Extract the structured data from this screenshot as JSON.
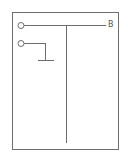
{
  "diagram": {
    "type": "schematic",
    "frame": {
      "x": 12,
      "y": 12,
      "width": 106,
      "height": 137,
      "stroke": "#6e6e6e"
    },
    "line_color": "#6e6e6e",
    "nodes": [
      {
        "id": "terminal-1",
        "shape": "circle",
        "cx": 21,
        "cy": 25,
        "r": 3
      },
      {
        "id": "terminal-2",
        "shape": "circle",
        "cx": 21,
        "cy": 43,
        "r": 3
      }
    ],
    "lines": [
      {
        "id": "top-bus",
        "x1": 24,
        "y1": 25,
        "x2": 106,
        "y2": 25
      },
      {
        "id": "vertical-trunk",
        "x1": 66,
        "y1": 25,
        "x2": 66,
        "y2": 143
      },
      {
        "id": "terminal-2-lead",
        "x1": 24,
        "y1": 43,
        "x2": 45,
        "y2": 43
      },
      {
        "id": "terminal-2-drop",
        "x1": 45,
        "y1": 43,
        "x2": 45,
        "y2": 60
      },
      {
        "id": "ground-bar",
        "x1": 38,
        "y1": 60,
        "x2": 54,
        "y2": 60
      }
    ],
    "labels": [
      {
        "id": "label-b",
        "text": "B"
      }
    ]
  }
}
